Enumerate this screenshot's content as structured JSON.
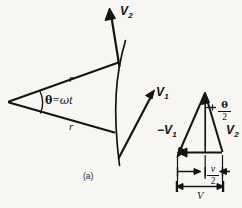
{
  "figure": {
    "part_label": "(a)",
    "background_color": "#f7f6f3",
    "ink_color": "#141414"
  },
  "sector_diagram": {
    "name": "circular-motion-sector",
    "radius_label_upper": "r",
    "radius_label_lower": "r",
    "angle": {
      "theta_symbol": "θ",
      "equals": "=",
      "omega_symbol": "ω",
      "time_symbol": "t",
      "full_text": "θ = ωt"
    },
    "vectors": [
      {
        "name": "v1",
        "letter": "V",
        "subscript": "1"
      },
      {
        "name": "v2",
        "letter": "V",
        "subscript": "2"
      }
    ]
  },
  "vector_triangle": {
    "name": "velocity-difference-triangle",
    "apex_angle": {
      "numerator": "θ",
      "denominator": "2"
    },
    "left_side_label": {
      "sign": "−",
      "letter": "V",
      "subscript": "1"
    },
    "right_side_label": {
      "letter": "V",
      "subscript": "2"
    },
    "half_dimension": {
      "numerator": "v",
      "denominator": "2"
    },
    "full_dimension": "V"
  }
}
